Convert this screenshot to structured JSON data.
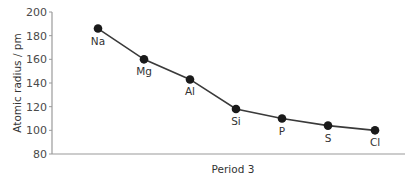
{
  "chart_data": {
    "type": "line",
    "title": "",
    "xlabel": "Period 3",
    "ylabel": "Atomic radius / pm",
    "categories": [
      "Na",
      "Mg",
      "Al",
      "Si",
      "P",
      "S",
      "Cl"
    ],
    "values": [
      186,
      160,
      143,
      118,
      110,
      104,
      100
    ],
    "ylim": [
      80,
      200
    ],
    "yticks": [
      80,
      100,
      120,
      140,
      160,
      180,
      200
    ],
    "grid": false,
    "legend": "none",
    "colors": {
      "line": "#3a3a3a",
      "marker": "#1a1a1a",
      "axis": "#9a9a9a"
    }
  }
}
